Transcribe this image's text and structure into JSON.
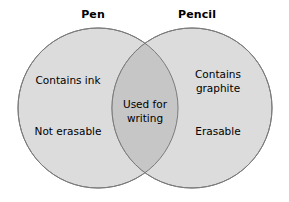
{
  "diagram": {
    "type": "venn",
    "title": "",
    "sets": [
      {
        "id": "pen",
        "label": "Pen",
        "items": [
          "Contains ink",
          "Not erasable"
        ]
      },
      {
        "id": "pencil",
        "label": "Pencil",
        "items": [
          "Contains\ngraphite",
          "Erasable"
        ]
      }
    ],
    "intersection": {
      "id": "pen-and-pencil",
      "items": [
        "Used for\nwriting"
      ]
    },
    "labels": {
      "left_title": "Pen",
      "right_title": "Pencil",
      "left_item_1": "Contains ink",
      "left_item_2": "Not erasable",
      "center_item_1": "Used for\nwriting",
      "right_item_1": "Contains\ngraphite",
      "right_item_2": "Erasable"
    },
    "colors": {
      "background": "#ffffff",
      "circle_fill": "#dcdcdc",
      "overlap_fill": "#c6c6c6",
      "circle_stroke": "#7a7a7a",
      "text": "#000000"
    },
    "geometry": {
      "left_circle": {
        "cx": 98,
        "cy": 108,
        "r": 80
      },
      "right_circle": {
        "cx": 192,
        "cy": 108,
        "r": 80
      },
      "stroke_width": 1
    }
  }
}
